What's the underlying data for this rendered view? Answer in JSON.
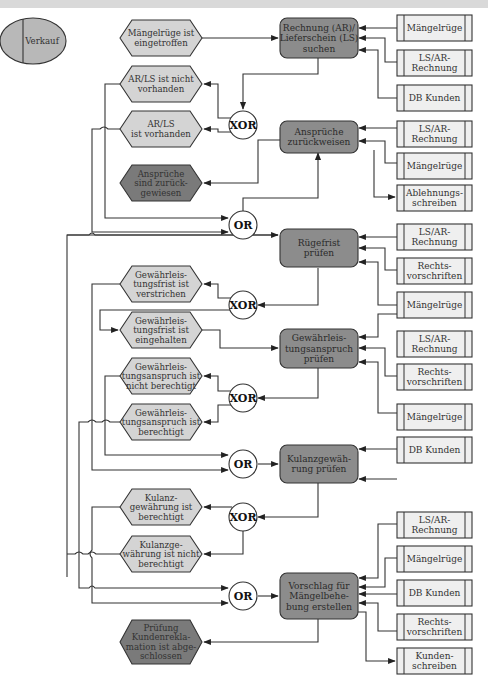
{
  "colors": {
    "org_unit_fill": "#b8b8b8",
    "event_fill": "#d4d4d4",
    "end_event_fill": "#7a7a7a",
    "function_fill": "#8c8c8c",
    "document_fill": "#efefef",
    "operator_fill": "#ffffff",
    "line": "#333333"
  },
  "org_unit": {
    "label": "Verkauf"
  },
  "events": [
    {
      "id": "e1",
      "lines": [
        "Mängelrüge ist",
        "eingetroffen"
      ]
    },
    {
      "id": "e2",
      "lines": [
        "AR/LS ist nicht",
        "vorhanden"
      ]
    },
    {
      "id": "e3",
      "lines": [
        "AR/LS",
        "ist vorhanden"
      ]
    },
    {
      "id": "e4",
      "lines": [
        "Ansprüche",
        "sind zurück-",
        "gewiesen"
      ],
      "terminal": true
    },
    {
      "id": "e5",
      "lines": [
        "Gewährleis-",
        "tungsfrist ist",
        "verstrichen"
      ]
    },
    {
      "id": "e6",
      "lines": [
        "Gewährleis-",
        "tungsfrist ist",
        "eingehalten"
      ]
    },
    {
      "id": "e7",
      "lines": [
        "Gewährleis-",
        "tungsanspruch ist",
        "nicht berechtigt"
      ]
    },
    {
      "id": "e8",
      "lines": [
        "Gewährleis-",
        "tungsanspruch ist",
        "berechtigt"
      ]
    },
    {
      "id": "e9",
      "lines": [
        "Kulanz-",
        "gewährung ist",
        "berechtigt"
      ]
    },
    {
      "id": "e10",
      "lines": [
        "Kulanzge-",
        "währung ist nicht",
        "berechtigt"
      ]
    },
    {
      "id": "e11",
      "lines": [
        "Prüfung",
        "Kundenrekla-",
        "mation ist abge-",
        "schlossen"
      ],
      "terminal": true
    }
  ],
  "functions": [
    {
      "id": "f1",
      "lines": [
        "Rechnung (AR)/",
        "Lieferschein (LS)",
        "suchen"
      ]
    },
    {
      "id": "f2",
      "lines": [
        "Ansprüche",
        "zurückweisen"
      ]
    },
    {
      "id": "f3",
      "lines": [
        "Rügefrist",
        "prüfen"
      ]
    },
    {
      "id": "f4",
      "lines": [
        "Gewährleis-",
        "tungsanspruch",
        "prüfen"
      ]
    },
    {
      "id": "f5",
      "lines": [
        "Kulanzgewäh-",
        "rung prüfen"
      ]
    },
    {
      "id": "f6",
      "lines": [
        "Vorschlag für",
        "Mängelbehe-",
        "bung erstellen"
      ]
    }
  ],
  "operators": [
    {
      "id": "x1",
      "label": "XOR"
    },
    {
      "id": "o1",
      "label": "OR"
    },
    {
      "id": "x2",
      "label": "XOR"
    },
    {
      "id": "x3",
      "label": "XOR"
    },
    {
      "id": "o2",
      "label": "OR"
    },
    {
      "id": "x4",
      "label": "XOR"
    },
    {
      "id": "o3",
      "label": "OR"
    }
  ],
  "documents": [
    {
      "id": "d1",
      "lines": [
        "Mängelrüge"
      ]
    },
    {
      "id": "d2",
      "lines": [
        "LS/AR-",
        "Rechnung"
      ]
    },
    {
      "id": "d3",
      "lines": [
        "DB Kunden"
      ]
    },
    {
      "id": "d4",
      "lines": [
        "LS/AR-",
        "Rechnung"
      ]
    },
    {
      "id": "d5",
      "lines": [
        "Mängelrüge"
      ]
    },
    {
      "id": "d6",
      "lines": [
        "Ablehnungs-",
        "schreiben"
      ]
    },
    {
      "id": "d7",
      "lines": [
        "LS/AR-",
        "Rechnung"
      ]
    },
    {
      "id": "d8",
      "lines": [
        "Rechts-",
        "vorschriften"
      ]
    },
    {
      "id": "d9",
      "lines": [
        "Mängelrüge"
      ]
    },
    {
      "id": "d10",
      "lines": [
        "LS/AR-",
        "Rechnung"
      ]
    },
    {
      "id": "d11",
      "lines": [
        "Rechts-",
        "vorschriften"
      ]
    },
    {
      "id": "d12",
      "lines": [
        "Mängelrüge"
      ]
    },
    {
      "id": "d13",
      "lines": [
        "DB Kunden"
      ]
    },
    {
      "id": "d14",
      "lines": [
        "LS/AR-",
        "Rechnung"
      ]
    },
    {
      "id": "d15",
      "lines": [
        "Mängelrüge"
      ]
    },
    {
      "id": "d16",
      "lines": [
        "DB Kunden"
      ]
    },
    {
      "id": "d17",
      "lines": [
        "Rechts-",
        "vorschriften"
      ]
    },
    {
      "id": "d18",
      "lines": [
        "Kunden-",
        "schreiben"
      ]
    }
  ]
}
